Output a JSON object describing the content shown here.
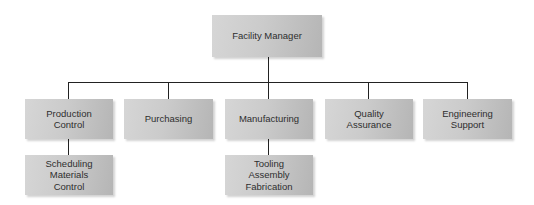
{
  "org_chart": {
    "root": {
      "label": "Facility Manager"
    },
    "departments": [
      {
        "label": "Production\nControl",
        "sub": "Scheduling\nMaterials\nControl"
      },
      {
        "label": "Purchasing"
      },
      {
        "label": "Manufacturing",
        "sub": "Tooling\nAssembly\nFabrication"
      },
      {
        "label": "Quality\nAssurance"
      },
      {
        "label": "Engineering\nSupport"
      }
    ]
  },
  "colors": {
    "box_light": "#d6d6d6",
    "box_dark": "#b5b5b5",
    "line": "#222222",
    "text": "#2e2e2e"
  }
}
